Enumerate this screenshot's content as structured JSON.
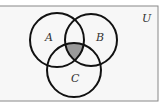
{
  "diagram": {
    "type": "venn",
    "universe_label": "U",
    "sets": [
      {
        "label": "A",
        "cx": 57,
        "cy": 40,
        "r": 27
      },
      {
        "label": "B",
        "cx": 91,
        "cy": 40,
        "r": 26
      },
      {
        "label": "C",
        "cx": 74,
        "cy": 70,
        "r": 27
      }
    ],
    "shaded_region": "A∩B∩C",
    "colors": {
      "background": "#f7f7f7",
      "stroke": "#111111",
      "shade": "#9a9a9a",
      "border": "#888888"
    }
  }
}
